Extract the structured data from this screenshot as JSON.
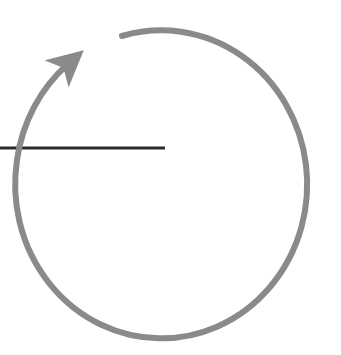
{
  "diagram": {
    "type": "rotation-arc",
    "colors": {
      "background": "#ffffff",
      "arc": "#8a8a8a",
      "radius_line": "#2a2a2a"
    },
    "arc": {
      "center": [
        161,
        184
      ],
      "rx": 146,
      "ry": 154,
      "stroke_width": 6,
      "direction": "counter-clockwise",
      "start_point": [
        122,
        35
      ],
      "end_point": [
        72,
        60
      ]
    },
    "radius_line": {
      "from": [
        0,
        148
      ],
      "to": [
        165,
        148
      ],
      "stroke_width": 3
    }
  }
}
